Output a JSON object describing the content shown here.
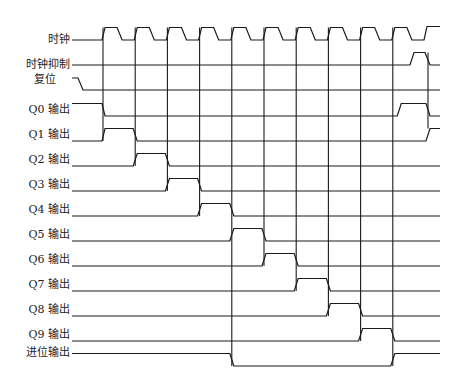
{
  "diagram": {
    "type": "timing-diagram",
    "clock_cycles": 10,
    "signals": [
      {
        "id": "clk",
        "label": "时钟",
        "kind": "clock"
      },
      {
        "id": "inh",
        "label": "时钟抑制",
        "kind": "level",
        "pulse_cycle": 10.5
      },
      {
        "id": "rst",
        "label": "复位",
        "kind": "level",
        "initial": "high",
        "falls_before_cycle": 0
      },
      {
        "id": "q0",
        "label": "Q0 输出",
        "kind": "level",
        "high_cycles": [
          [
            -1,
            0
          ],
          [
            9.5,
            10.5
          ]
        ]
      },
      {
        "id": "q1",
        "label": "Q1 输出",
        "kind": "level",
        "high_cycles": [
          [
            0,
            1
          ],
          [
            10.5,
            11
          ]
        ]
      },
      {
        "id": "q2",
        "label": "Q2 输出",
        "kind": "level",
        "high_cycles": [
          [
            1,
            2
          ]
        ]
      },
      {
        "id": "q3",
        "label": "Q3 输出",
        "kind": "level",
        "high_cycles": [
          [
            2,
            3
          ]
        ]
      },
      {
        "id": "q4",
        "label": "Q4 输出",
        "kind": "level",
        "high_cycles": [
          [
            3,
            4
          ]
        ]
      },
      {
        "id": "q5",
        "label": "Q5 输出",
        "kind": "level",
        "high_cycles": [
          [
            4,
            5
          ]
        ]
      },
      {
        "id": "q6",
        "label": "Q6 输出",
        "kind": "level",
        "high_cycles": [
          [
            5,
            6
          ]
        ]
      },
      {
        "id": "q7",
        "label": "Q7 输出",
        "kind": "level",
        "high_cycles": [
          [
            6,
            7
          ]
        ]
      },
      {
        "id": "q8",
        "label": "Q8 输出",
        "kind": "level",
        "high_cycles": [
          [
            7,
            8
          ]
        ]
      },
      {
        "id": "q9",
        "label": "Q9 输出",
        "kind": "level",
        "high_cycles": [
          [
            8,
            9
          ]
        ]
      },
      {
        "id": "co",
        "label": "进位输出",
        "kind": "level",
        "low_cycles": [
          [
            4,
            9
          ]
        ]
      }
    ]
  }
}
